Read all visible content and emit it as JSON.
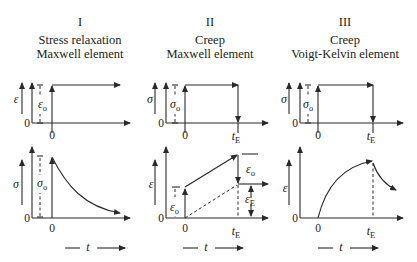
{
  "panels": [
    {
      "numeral": "I",
      "title_line1": "Stress relaxation",
      "title_line2": "Maxwell element",
      "top_plot": {
        "y_label": "ε",
        "level_label": "ε",
        "level_sub": "o",
        "origin": "0",
        "x_tick": "0"
      },
      "bottom_plot": {
        "y_label": "σ",
        "level_label": "σ",
        "level_sub": "o",
        "origin": "0",
        "x_tick": "0",
        "x_label": "t"
      }
    },
    {
      "numeral": "II",
      "title_line1": "Creep",
      "title_line2": "Maxwell element",
      "top_plot": {
        "y_label": "σ",
        "level_label": "σ",
        "level_sub": "o",
        "origin": "0",
        "x_tick": "0",
        "x_tick_end": "t",
        "x_tick_end_sub": "E"
      },
      "bottom_plot": {
        "y_label": "ε",
        "level_label": "ε",
        "level_sub": "o",
        "drop_label": "ε",
        "drop_sub": "o",
        "residual_label": "ε",
        "residual_sub": "E",
        "origin": "0",
        "x_tick": "0",
        "x_tick_end": "t",
        "x_tick_end_sub": "E",
        "x_label": "t"
      }
    },
    {
      "numeral": "III",
      "title_line1": "Creep",
      "title_line2": "Voigt-Kelvin element",
      "top_plot": {
        "y_label": "σ",
        "level_label": "σ",
        "level_sub": "o",
        "origin": "0",
        "x_tick": "0",
        "x_tick_end": "t",
        "x_tick_end_sub": "E"
      },
      "bottom_plot": {
        "y_label": "ε",
        "origin": "0",
        "x_tick": "0",
        "x_tick_end": "t",
        "x_tick_end_sub": "E",
        "x_label": "t"
      }
    }
  ]
}
